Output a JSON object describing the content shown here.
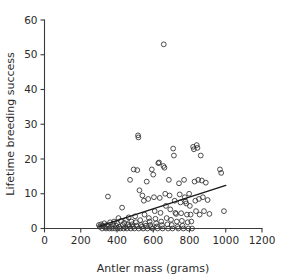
{
  "chart_data": {
    "type": "scatter",
    "title": "",
    "xlabel": "Antler mass (grams)",
    "ylabel": "Lifetime breeding success",
    "xlim": [
      0,
      1200
    ],
    "ylim": [
      0,
      60
    ],
    "xticks": [
      0,
      200,
      400,
      600,
      800,
      1000,
      1200
    ],
    "yticks": [
      0,
      10,
      20,
      30,
      40,
      50,
      60
    ],
    "xtick_labels": [
      "0",
      "200",
      "400",
      "600",
      "800",
      "1000",
      "1200"
    ],
    "ytick_labels": [
      "0",
      "10",
      "20",
      "30",
      "40",
      "50",
      "60"
    ],
    "grid": false,
    "legend": null,
    "marker": {
      "shape": "open-circle",
      "radius_px": 2.4,
      "edge_color": "#2e2e2e",
      "fill": "none"
    },
    "trendline": {
      "type": "linear-fit",
      "color": "#1a1a1a",
      "x_start": 300,
      "y_start": 0.6,
      "x_end": 1000,
      "y_end": 12.4
    },
    "points": [
      [
        300,
        1.0
      ],
      [
        305,
        0.5
      ],
      [
        312,
        1.2
      ],
      [
        318,
        0.0
      ],
      [
        322,
        0.8
      ],
      [
        330,
        1.5
      ],
      [
        335,
        0.3
      ],
      [
        340,
        0.0
      ],
      [
        344,
        1.0
      ],
      [
        350,
        9.2
      ],
      [
        352,
        0.6
      ],
      [
        358,
        0.0
      ],
      [
        362,
        1.8
      ],
      [
        368,
        0.5
      ],
      [
        372,
        0.0
      ],
      [
        378,
        1.2
      ],
      [
        384,
        2.0
      ],
      [
        390,
        0.0
      ],
      [
        395,
        0.8
      ],
      [
        400,
        1.5
      ],
      [
        404,
        0.0
      ],
      [
        408,
        3.0
      ],
      [
        412,
        0.5
      ],
      [
        418,
        0.0
      ],
      [
        422,
        2.2
      ],
      [
        428,
        6.0
      ],
      [
        432,
        1.0
      ],
      [
        436,
        0.0
      ],
      [
        440,
        1.6
      ],
      [
        446,
        0.4
      ],
      [
        450,
        2.5
      ],
      [
        455,
        0.0
      ],
      [
        460,
        1.0
      ],
      [
        464,
        3.2
      ],
      [
        468,
        0.6
      ],
      [
        472,
        14.0
      ],
      [
        476,
        0.0
      ],
      [
        480,
        2.0
      ],
      [
        484,
        1.2
      ],
      [
        488,
        0.5
      ],
      [
        492,
        17.0
      ],
      [
        496,
        0.0
      ],
      [
        500,
        3.5
      ],
      [
        504,
        1.8
      ],
      [
        508,
        0.8
      ],
      [
        512,
        16.8
      ],
      [
        516,
        26.8
      ],
      [
        518,
        26.2
      ],
      [
        520,
        0.0
      ],
      [
        524,
        11.0
      ],
      [
        528,
        2.4
      ],
      [
        532,
        1.0
      ],
      [
        536,
        0.5
      ],
      [
        540,
        9.5
      ],
      [
        544,
        0.0
      ],
      [
        548,
        8.0
      ],
      [
        552,
        4.0
      ],
      [
        556,
        1.5
      ],
      [
        560,
        0.8
      ],
      [
        564,
        13.5
      ],
      [
        568,
        0.0
      ],
      [
        572,
        8.5
      ],
      [
        576,
        3.0
      ],
      [
        580,
        2.0
      ],
      [
        584,
        1.0
      ],
      [
        588,
        0.4
      ],
      [
        592,
        17.0
      ],
      [
        596,
        0.0
      ],
      [
        600,
        15.5
      ],
      [
        604,
        9.0
      ],
      [
        608,
        5.0
      ],
      [
        612,
        2.8
      ],
      [
        616,
        1.5
      ],
      [
        620,
        0.6
      ],
      [
        624,
        0.0
      ],
      [
        628,
        18.8
      ],
      [
        632,
        19.0
      ],
      [
        636,
        8.8
      ],
      [
        640,
        4.5
      ],
      [
        644,
        2.0
      ],
      [
        648,
        1.0
      ],
      [
        652,
        0.0
      ],
      [
        656,
        18.0
      ],
      [
        658,
        53.0
      ],
      [
        662,
        17.5
      ],
      [
        666,
        10.0
      ],
      [
        670,
        6.5
      ],
      [
        674,
        3.0
      ],
      [
        678,
        1.2
      ],
      [
        682,
        0.0
      ],
      [
        686,
        14.0
      ],
      [
        690,
        9.5
      ],
      [
        694,
        5.5
      ],
      [
        698,
        2.5
      ],
      [
        702,
        1.0
      ],
      [
        706,
        0.0
      ],
      [
        710,
        23.0
      ],
      [
        714,
        21.0
      ],
      [
        718,
        8.0
      ],
      [
        722,
        4.5
      ],
      [
        726,
        4.2
      ],
      [
        730,
        2.0
      ],
      [
        734,
        0.5
      ],
      [
        738,
        0.0
      ],
      [
        742,
        13.0
      ],
      [
        746,
        9.8
      ],
      [
        750,
        7.5
      ],
      [
        754,
        4.4
      ],
      [
        758,
        2.2
      ],
      [
        762,
        0.8
      ],
      [
        766,
        0.0
      ],
      [
        770,
        14.0
      ],
      [
        774,
        9.0
      ],
      [
        778,
        7.8
      ],
      [
        782,
        7.2
      ],
      [
        786,
        4.0
      ],
      [
        790,
        1.8
      ],
      [
        794,
        0.0
      ],
      [
        798,
        10.0
      ],
      [
        802,
        6.5
      ],
      [
        806,
        4.0
      ],
      [
        810,
        2.0
      ],
      [
        814,
        0.0
      ],
      [
        820,
        23.5
      ],
      [
        824,
        22.8
      ],
      [
        828,
        13.5
      ],
      [
        832,
        8.0
      ],
      [
        836,
        5.0
      ],
      [
        840,
        24.0
      ],
      [
        844,
        23.2
      ],
      [
        848,
        14.0
      ],
      [
        852,
        8.5
      ],
      [
        856,
        4.0
      ],
      [
        862,
        21.0
      ],
      [
        868,
        13.8
      ],
      [
        874,
        9.0
      ],
      [
        880,
        5.0
      ],
      [
        890,
        13.2
      ],
      [
        900,
        8.2
      ],
      [
        910,
        4.2
      ],
      [
        968,
        17.0
      ],
      [
        975,
        16.0
      ],
      [
        990,
        5.0
      ]
    ]
  },
  "axes": {
    "x_axis_name": "x-axis",
    "y_axis_name": "y-axis"
  }
}
